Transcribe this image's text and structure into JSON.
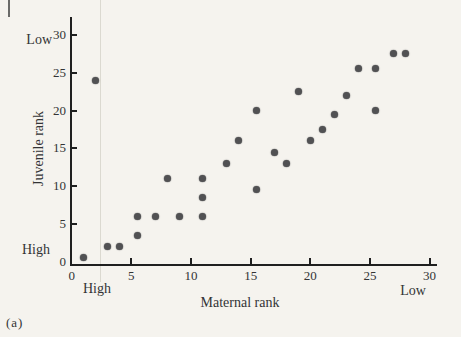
{
  "figure_label": "(a)",
  "colors": {
    "background": "#f5f3ee",
    "dot": "#515153",
    "axis": "#1f1f1f",
    "text": "#333335"
  },
  "chart_data": {
    "type": "scatter",
    "title": "",
    "xlabel": "Maternal rank",
    "ylabel": "Juvenile rank",
    "xlim": [
      0,
      30
    ],
    "ylim": [
      0,
      30
    ],
    "x_ticks": [
      0,
      5,
      10,
      15,
      20,
      25,
      30
    ],
    "y_ticks": [
      0,
      5,
      10,
      15,
      20,
      25,
      30
    ],
    "grid": false,
    "legend": false,
    "x_axis_annotations": {
      "left": "High",
      "right": "Low"
    },
    "y_axis_annotations": {
      "top": "Low",
      "bottom": "High"
    },
    "points": [
      [
        1,
        0.5
      ],
      [
        2,
        24
      ],
      [
        3,
        2
      ],
      [
        4,
        2
      ],
      [
        5.5,
        3.5
      ],
      [
        5.5,
        6
      ],
      [
        7,
        6
      ],
      [
        8,
        11
      ],
      [
        9,
        6
      ],
      [
        11,
        6
      ],
      [
        11,
        8.5
      ],
      [
        11,
        11
      ],
      [
        13,
        13
      ],
      [
        14,
        16
      ],
      [
        15.5,
        9.5
      ],
      [
        15.5,
        20
      ],
      [
        17,
        14.5
      ],
      [
        18,
        13
      ],
      [
        19,
        22.5
      ],
      [
        20,
        16
      ],
      [
        21,
        17.5
      ],
      [
        22,
        19.5
      ],
      [
        23,
        22
      ],
      [
        24,
        25.5
      ],
      [
        25.5,
        20
      ],
      [
        25.5,
        25.5
      ],
      [
        27,
        27.5
      ],
      [
        28,
        27.5
      ]
    ]
  }
}
